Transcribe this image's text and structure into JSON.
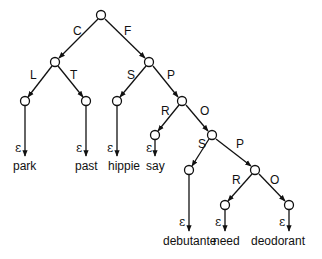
{
  "diagram": {
    "type": "trie",
    "nodes": [
      {
        "id": "root",
        "x": 101,
        "y": 15
      },
      {
        "id": "C",
        "x": 55,
        "y": 62
      },
      {
        "id": "F",
        "x": 149,
        "y": 62
      },
      {
        "id": "CL",
        "x": 25,
        "y": 101
      },
      {
        "id": "CT",
        "x": 86,
        "y": 101
      },
      {
        "id": "FS",
        "x": 117,
        "y": 101
      },
      {
        "id": "FP",
        "x": 182,
        "y": 101
      },
      {
        "id": "FPR",
        "x": 155,
        "y": 135
      },
      {
        "id": "FPO",
        "x": 212,
        "y": 135
      },
      {
        "id": "FPOS",
        "x": 189,
        "y": 170
      },
      {
        "id": "FPOP",
        "x": 255,
        "y": 170
      },
      {
        "id": "FPOPR",
        "x": 225,
        "y": 205
      },
      {
        "id": "FPOPO",
        "x": 289,
        "y": 205
      }
    ],
    "edges": [
      {
        "from": "root",
        "to": "C",
        "label": "C"
      },
      {
        "from": "root",
        "to": "F",
        "label": "F"
      },
      {
        "from": "C",
        "to": "CL",
        "label": "L"
      },
      {
        "from": "C",
        "to": "CT",
        "label": "T"
      },
      {
        "from": "F",
        "to": "FS",
        "label": "S"
      },
      {
        "from": "F",
        "to": "FP",
        "label": "P"
      },
      {
        "from": "FP",
        "to": "FPR",
        "label": "R"
      },
      {
        "from": "FP",
        "to": "FPO",
        "label": "O"
      },
      {
        "from": "FPO",
        "to": "FPOS",
        "label": "S"
      },
      {
        "from": "FPO",
        "to": "FPOP",
        "label": "P"
      },
      {
        "from": "FPOP",
        "to": "FPOPR",
        "label": "R"
      },
      {
        "from": "FPOP",
        "to": "FPOPO",
        "label": "O"
      }
    ],
    "leaves": [
      {
        "node": "CL",
        "epsilon": "ε",
        "word": "park"
      },
      {
        "node": "CT",
        "epsilon": "ε",
        "word": "past"
      },
      {
        "node": "FS",
        "epsilon": "ε",
        "word": "hippie"
      },
      {
        "node": "FPR",
        "epsilon": "ε",
        "word": "say"
      },
      {
        "node": "FPOS",
        "epsilon": "ε",
        "word": "debutante"
      },
      {
        "node": "FPOPR",
        "epsilon": "ε",
        "word": "need"
      },
      {
        "node": "FPOPO",
        "epsilon": "ε",
        "word": "deodorant"
      }
    ]
  },
  "labels": {
    "e_root_C": "C",
    "e_root_F": "F",
    "e_C_L": "L",
    "e_C_T": "T",
    "e_F_S": "S",
    "e_F_P": "P",
    "e_FP_R": "R",
    "e_FP_O": "O",
    "e_FPO_S": "S",
    "e_FPO_P": "P",
    "e_FPOP_R": "R",
    "e_FPOP_O": "O"
  },
  "epsilon": "ε",
  "words": {
    "park": "park",
    "past": "past",
    "hippie": "hippie",
    "say": "say",
    "debutante": "debutante",
    "need": "need",
    "deodorant": "deodorant"
  }
}
